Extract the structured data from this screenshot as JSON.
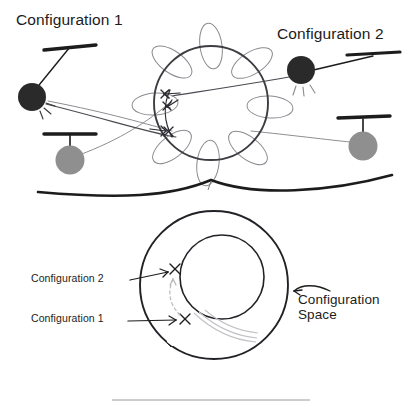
{
  "figure": {
    "title_top_left": "Configuration 1",
    "title_top_right": "Configuration 2",
    "cspace_label_upper": "Configuration 2",
    "cspace_label_lower": "Configuration 1",
    "cspace_name_line1": "Configuration",
    "cspace_name_line2": "Space"
  },
  "colors": {
    "ink": "#1c1c1c",
    "bob_dark": "#2b2b2b",
    "bob_gray": "#8f8f8f",
    "ellipse_gray": "#8a8a91",
    "faint_gray": "#b9b9bd",
    "divider": "#9a9a9a"
  },
  "top_panel": {
    "pendulums": [
      {
        "name": "pendulum-config-1",
        "bob": "dark",
        "pivot_x": 70,
        "pivot_y": 47,
        "bob_x": 32,
        "bob_y": 97,
        "bob_r": 14
      },
      {
        "name": "pendulum-rest-left",
        "bob": "gray",
        "pivot_x": 70,
        "pivot_y": 136,
        "bob_x": 70,
        "bob_y": 157,
        "bob_r": 14
      },
      {
        "name": "pendulum-config-2",
        "bob": "dark",
        "pivot_x": 373,
        "pivot_y": 56,
        "bob_x": 301,
        "bob_y": 70,
        "bob_r": 14
      },
      {
        "name": "pendulum-rest-right",
        "bob": "gray",
        "pivot_x": 363,
        "pivot_y": 121,
        "bob_x": 363,
        "bob_y": 143,
        "bob_r": 14
      }
    ],
    "manifold_circle": {
      "cx": 211,
      "cy": 103,
      "r": 57
    },
    "fiber_ellipse_count": 8,
    "marker_count": 3,
    "marker_glyph": "X"
  },
  "bottom_panel": {
    "annulus": {
      "outer": {
        "cx": 214,
        "cy": 285,
        "r": 74
      },
      "inner": {
        "cx": 222,
        "cy": 277,
        "r": 42
      }
    },
    "markers": [
      {
        "name": "marker-config-2",
        "x": 174,
        "y": 278,
        "glyph": "X"
      },
      {
        "name": "marker-config-1",
        "x": 186,
        "y": 320,
        "glyph": "X"
      }
    ],
    "path_arrow": "dashed-upward-arc"
  }
}
